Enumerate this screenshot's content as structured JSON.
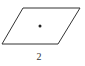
{
  "figure": {
    "shape": "parallelogram",
    "vertices": [
      [
        23,
        8
      ],
      [
        80,
        8
      ],
      [
        58,
        44
      ],
      [
        2,
        44
      ]
    ],
    "center_dot": [
      40,
      26
    ],
    "stroke_color": "#333333",
    "label": "2"
  }
}
